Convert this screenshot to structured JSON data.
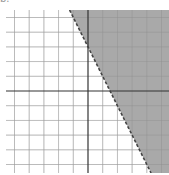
{
  "chart_data": {
    "type": "inequality_graph",
    "title": "",
    "corner_label": "b.",
    "inequality": "y > -2x + 3",
    "boundary": {
      "slope": -2,
      "intercept": 3,
      "style": "dashed"
    },
    "shaded_region": "above/right of boundary line",
    "xlim": [
      -5.6,
      5.5
    ],
    "ylim": [
      -5.6,
      5.5
    ],
    "grid": true,
    "grid_step": 1,
    "axes": {
      "x_axis": true,
      "y_axis": true,
      "tick_labels": false
    },
    "points_on_boundary": [
      [
        0,
        3
      ],
      [
        1.5,
        0
      ]
    ],
    "colors": {
      "shade": "#a9a9a9",
      "grid": "#d6d6d6",
      "axis": "#333333",
      "boundary": "#444444"
    }
  }
}
